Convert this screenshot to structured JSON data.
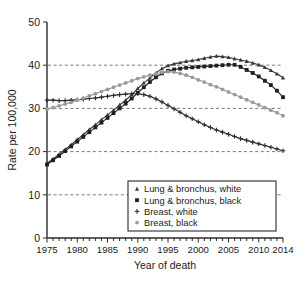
{
  "chart_data": {
    "type": "line",
    "title": "",
    "xlabel": "Year of death",
    "ylabel": "Rate per 100,000",
    "xlim": [
      1975,
      2014
    ],
    "ylim": [
      0,
      50
    ],
    "xticks": [
      1975,
      1980,
      1985,
      1990,
      1995,
      2000,
      2005,
      2010,
      2014
    ],
    "yticks": [
      0,
      10,
      20,
      30,
      40,
      50
    ],
    "grid": "horizontal-dashed",
    "legend_position": "bottom-center",
    "x": [
      1975,
      1976,
      1977,
      1978,
      1979,
      1980,
      1981,
      1982,
      1983,
      1984,
      1985,
      1986,
      1987,
      1988,
      1989,
      1990,
      1991,
      1992,
      1993,
      1994,
      1995,
      1996,
      1997,
      1998,
      1999,
      2000,
      2001,
      2002,
      2003,
      2004,
      2005,
      2006,
      2007,
      2008,
      2009,
      2010,
      2011,
      2012,
      2013,
      2014
    ],
    "series": [
      {
        "name": "Lung & bronchus, white",
        "marker": "triangle",
        "color": "#3a3a3a",
        "values": [
          17.3,
          18.3,
          19.4,
          20.5,
          21.6,
          22.8,
          23.9,
          25.1,
          26.2,
          27.4,
          28.5,
          29.6,
          30.8,
          31.9,
          33.2,
          34.6,
          35.9,
          37.0,
          38.2,
          39.2,
          39.9,
          40.3,
          40.6,
          40.9,
          41.1,
          41.3,
          41.6,
          41.9,
          42.1,
          42.0,
          41.8,
          41.5,
          41.2,
          40.9,
          40.5,
          40.1,
          39.5,
          38.8,
          38.0,
          37.1
        ]
      },
      {
        "name": "Lung & bronchus, black",
        "marker": "square",
        "color": "#1f1f1f",
        "values": [
          17.0,
          18.0,
          19.0,
          20.1,
          21.2,
          22.3,
          23.4,
          24.5,
          25.6,
          26.7,
          27.8,
          28.9,
          30.0,
          31.1,
          32.3,
          33.6,
          34.9,
          36.1,
          37.2,
          38.1,
          38.7,
          39.0,
          39.2,
          39.4,
          39.5,
          39.6,
          39.7,
          39.8,
          39.9,
          40.0,
          40.1,
          40.1,
          39.6,
          38.9,
          38.2,
          37.4,
          36.4,
          35.4,
          34.1,
          32.6
        ]
      },
      {
        "name": "Breast, white",
        "marker": "plus",
        "color": "#2b2b2b",
        "values": [
          31.9,
          31.9,
          31.8,
          31.8,
          31.9,
          32.0,
          32.1,
          32.3,
          32.4,
          32.6,
          32.8,
          33.0,
          33.2,
          33.3,
          33.4,
          33.4,
          33.2,
          32.8,
          32.2,
          31.5,
          30.7,
          29.9,
          29.1,
          28.3,
          27.6,
          26.9,
          26.2,
          25.6,
          25.0,
          24.5,
          24.0,
          23.5,
          23.0,
          22.6,
          22.2,
          21.8,
          21.4,
          21.0,
          20.6,
          20.2
        ]
      },
      {
        "name": "Breast, black",
        "marker": "circle",
        "color": "#9a9a9a",
        "values": [
          29.8,
          30.2,
          30.6,
          31.0,
          31.4,
          31.9,
          32.4,
          32.9,
          33.4,
          33.9,
          34.4,
          34.9,
          35.4,
          35.9,
          36.4,
          36.9,
          37.3,
          37.7,
          38.0,
          38.3,
          38.5,
          38.4,
          38.1,
          37.7,
          37.2,
          36.6,
          36.1,
          35.5,
          35.0,
          34.4,
          33.8,
          33.2,
          32.6,
          32.0,
          31.4,
          30.8,
          30.2,
          29.6,
          29.0,
          28.3
        ]
      }
    ]
  },
  "legend": {
    "items": [
      {
        "label": "Lung & bronchus, white"
      },
      {
        "label": "Lung & bronchus, black"
      },
      {
        "label": "Breast, white"
      },
      {
        "label": "Breast, black"
      }
    ]
  }
}
